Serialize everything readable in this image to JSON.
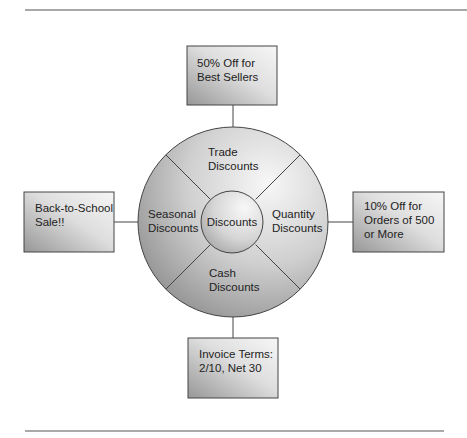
{
  "diagram": {
    "type": "hub-and-spoke",
    "center": {
      "label": "Discounts"
    },
    "segments": {
      "top": {
        "line1": "Trade",
        "line2": "Discounts"
      },
      "left": {
        "line1": "Seasonal",
        "line2": "Discounts"
      },
      "right": {
        "line1": "Quantity",
        "line2": "Discounts"
      },
      "bottom": {
        "line1": "Cash",
        "line2": "Discounts"
      }
    },
    "examples": {
      "top": {
        "line1": "50% Off for",
        "line2": "Best Sellers"
      },
      "left": {
        "line1": "Back-to-School",
        "line2": "Sale!!"
      },
      "right": {
        "line1": "10% Off for",
        "line2": "Orders of 500",
        "line3": "or More"
      },
      "bottom": {
        "line1": "Invoice Terms:",
        "line2": "2/10, Net 30"
      }
    }
  },
  "colors": {
    "stroke": "#444444",
    "rule": "#555555",
    "fill_light": "#f4f4f4",
    "fill_dark": "#8e8e8e",
    "text": "#222222"
  }
}
